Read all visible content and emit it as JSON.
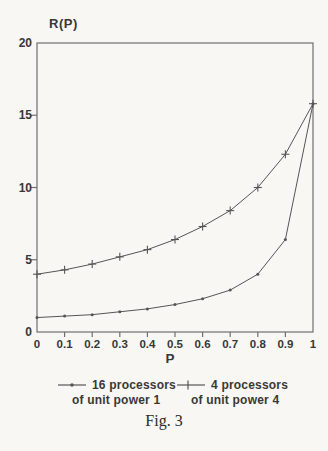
{
  "caption": "Fig. 3",
  "colors": {
    "background": "#f8f7f4",
    "frame": "#6f6f6f",
    "line": "#555555",
    "text": "#383838"
  },
  "legend": {
    "items": [
      {
        "marker": "dot",
        "line1": "16 processors",
        "line2": "of unit power 1"
      },
      {
        "marker": "plus",
        "line1": "4 processors",
        "line2": "of unit power 4"
      }
    ]
  },
  "chart_data": {
    "type": "line",
    "title": "",
    "xlabel": "P",
    "ylabel": "R(P)",
    "xlim": [
      0,
      1
    ],
    "ylim": [
      0,
      20
    ],
    "grid": false,
    "legend_position": "bottom",
    "x": [
      0,
      0.1,
      0.2,
      0.3,
      0.4,
      0.5,
      0.6,
      0.7,
      0.8,
      0.9,
      1
    ],
    "x_tick_labels": [
      "0",
      "0.1",
      "0.2",
      "0.3",
      "0.4",
      "0.5",
      "0.6",
      "0.7",
      "0.8",
      "0.9",
      "1"
    ],
    "y_ticks": [
      0,
      5,
      10,
      15,
      20
    ],
    "y_tick_labels": [
      "0",
      "5",
      "10",
      "15",
      "20"
    ],
    "series": [
      {
        "name": "16 processors of unit power 1",
        "marker": "dot",
        "values": [
          1.0,
          1.1,
          1.2,
          1.4,
          1.6,
          1.9,
          2.3,
          2.9,
          4.0,
          6.4,
          15.8
        ]
      },
      {
        "name": "4 processors of unit power 4",
        "marker": "plus",
        "values": [
          4.0,
          4.3,
          4.7,
          5.2,
          5.7,
          6.4,
          7.3,
          8.4,
          10.0,
          12.3,
          15.8
        ]
      }
    ]
  }
}
